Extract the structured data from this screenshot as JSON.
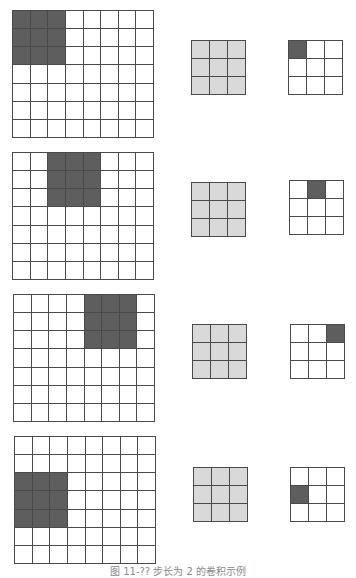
{
  "figure": {
    "caption": "图 11-?? 步长为 2 的卷积示例",
    "colors": {
      "receptive_field": "#5e5e5e",
      "kernel": "#d9d9d9",
      "empty": "#ffffff",
      "grid_line": "#4a4a4a"
    },
    "input_size": {
      "cols": 8,
      "rows": 7
    },
    "kernel_size": {
      "cols": 3,
      "rows": 3
    },
    "output_size": {
      "cols": 3,
      "rows": 3
    },
    "stride": 2,
    "steps": [
      {
        "step": 1,
        "input_window": {
          "col": 0,
          "row": 0,
          "width": 3,
          "height": 3
        },
        "output_cell": {
          "col": 0,
          "row": 0
        },
        "positions": {
          "input": [
            12,
            10
          ],
          "kernel": [
            191,
            40
          ],
          "output": [
            288,
            40
          ]
        }
      },
      {
        "step": 2,
        "input_window": {
          "col": 2,
          "row": 0,
          "width": 3,
          "height": 3
        },
        "output_cell": {
          "col": 1,
          "row": 0
        },
        "positions": {
          "input": [
            12,
            152
          ],
          "kernel": [
            191,
            182
          ],
          "output": [
            289,
            180
          ]
        }
      },
      {
        "step": 3,
        "input_window": {
          "col": 4,
          "row": 0,
          "width": 3,
          "height": 3
        },
        "output_cell": {
          "col": 2,
          "row": 0
        },
        "positions": {
          "input": [
            13,
            294
          ],
          "kernel": [
            192,
            324
          ],
          "output": [
            290,
            324
          ]
        }
      },
      {
        "step": 4,
        "input_window": {
          "col": 0,
          "row": 2,
          "width": 3,
          "height": 3
        },
        "output_cell": {
          "col": 0,
          "row": 1
        },
        "positions": {
          "input": [
            14,
            436
          ],
          "kernel": [
            193,
            467
          ],
          "output": [
            290,
            467
          ]
        }
      }
    ]
  }
}
